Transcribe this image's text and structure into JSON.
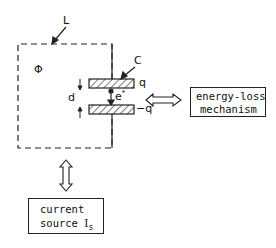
{
  "diagram": {
    "inductor_label": "L",
    "flux_label": "Φ",
    "capacitor_label": "C",
    "gap_label": "d",
    "electron_label": "e",
    "electron_superscript": "*",
    "upper_charge": "q",
    "lower_charge": "−q",
    "energy_loss_box": {
      "line1": "energy-loss",
      "line2": "mechanism"
    },
    "current_source_box": {
      "line1": "current",
      "line2": "source ",
      "symbol": "I",
      "subscript": "s"
    },
    "colors": {
      "line": "#222222",
      "background": "#ffffff"
    }
  }
}
